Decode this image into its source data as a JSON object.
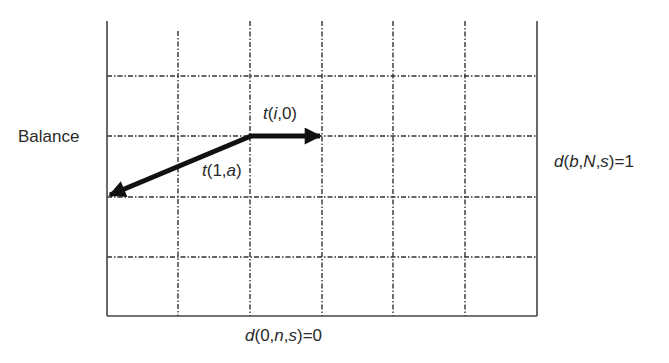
{
  "diagram": {
    "type": "grid-vector-diagram",
    "grid": {
      "x_lines": [
        107,
        178,
        250,
        322,
        393,
        465,
        537
      ],
      "y_lines": [
        76,
        136,
        197,
        257
      ],
      "border": {
        "left": 107,
        "right": 537,
        "top": 21,
        "bottom": 316
      },
      "line_color": "#333333"
    },
    "arrows": [
      {
        "name": "t(i,0)",
        "from": [
          250,
          136
        ],
        "to": [
          322,
          136
        ]
      },
      {
        "name": "t(1,a)",
        "from": [
          250,
          136
        ],
        "to": [
          107,
          196
        ]
      }
    ],
    "labels": {
      "left_axis": "Balance",
      "right_side": {
        "pre": "d(",
        "a": "b",
        "c1": ",",
        "b": "N",
        "c2": ",",
        "c": "s",
        "post": ")=1"
      },
      "bottom": {
        "pre": "d(0,",
        "a": "n",
        "c1": ",",
        "b": "s",
        "post": ")=0"
      },
      "arrow_right": {
        "t": "t",
        "open": "(",
        "i": "i",
        "rest": ",0)"
      },
      "arrow_left": {
        "t": "t",
        "open": "(1,",
        "a": "a",
        "close": ")"
      }
    }
  }
}
